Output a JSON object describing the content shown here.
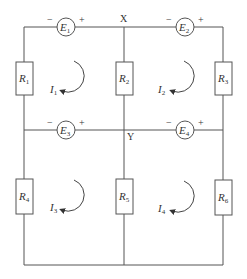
{
  "diagram": {
    "type": "circuit",
    "nodes": [
      {
        "label": "X"
      },
      {
        "label": "Y"
      }
    ],
    "sources": [
      {
        "name": "E",
        "sub": "1",
        "neg": "−",
        "pos": "+"
      },
      {
        "name": "E",
        "sub": "2",
        "neg": "−",
        "pos": "+"
      },
      {
        "name": "E",
        "sub": "3",
        "neg": "−",
        "pos": "+"
      },
      {
        "name": "E",
        "sub": "4",
        "neg": "−",
        "pos": "+"
      }
    ],
    "resistors": [
      {
        "name": "R",
        "sub": "1"
      },
      {
        "name": "R",
        "sub": "2"
      },
      {
        "name": "R",
        "sub": "3"
      },
      {
        "name": "R",
        "sub": "4"
      },
      {
        "name": "R",
        "sub": "5"
      },
      {
        "name": "R",
        "sub": "6"
      }
    ],
    "loop_currents": [
      {
        "name": "I",
        "sub": "1"
      },
      {
        "name": "I",
        "sub": "2"
      },
      {
        "name": "I",
        "sub": "3"
      },
      {
        "name": "I",
        "sub": "4"
      }
    ]
  }
}
